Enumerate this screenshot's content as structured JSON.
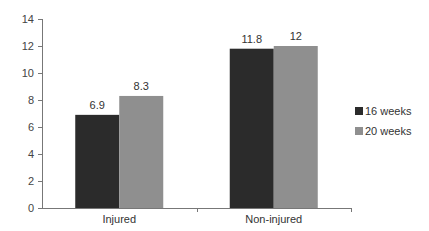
{
  "chart_data": {
    "type": "bar",
    "title": "",
    "xlabel": "",
    "ylabel": "",
    "ylim": [
      0,
      14
    ],
    "yticks": [
      0,
      2,
      4,
      6,
      8,
      10,
      12,
      14
    ],
    "grid": false,
    "legend_position": "right",
    "categories": [
      "Injured",
      "Non-injured"
    ],
    "series": [
      {
        "name": "16 weeks",
        "color": "#2b2b2b",
        "values": [
          6.9,
          11.8
        ],
        "labels": [
          "6.9",
          "11.8"
        ]
      },
      {
        "name": "20 weeks",
        "color": "#8f8f8f",
        "values": [
          8.3,
          12
        ],
        "labels": [
          "8.3",
          "12"
        ]
      }
    ]
  }
}
